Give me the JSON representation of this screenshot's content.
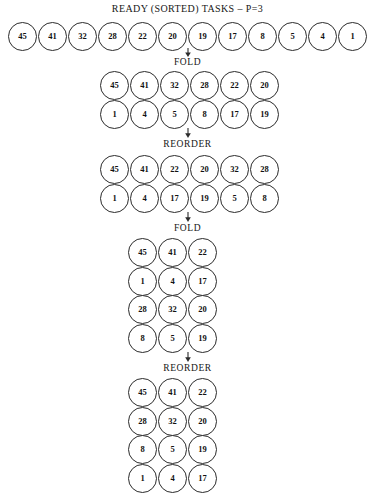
{
  "title": "READY (SORTED) TASKS – P=3",
  "footer_note": "",
  "colors": {
    "background": "#ffffff",
    "stroke": "#2b2b2b",
    "text": "#111111"
  },
  "labels": {
    "fold": "FOLD",
    "reorder": "REORDER"
  },
  "chart_data": {
    "type": "diagram",
    "title": "READY (SORTED) TASKS – P=3",
    "processors": 3,
    "stages": [
      {
        "name": "initial",
        "label": "",
        "columns": 12,
        "rows": [
          [
            45,
            41,
            32,
            28,
            22,
            20,
            19,
            17,
            8,
            5,
            4,
            1
          ]
        ]
      },
      {
        "name": "fold-1",
        "label": "FOLD",
        "columns": 6,
        "rows": [
          [
            45,
            41,
            32,
            28,
            22,
            20
          ],
          [
            1,
            4,
            5,
            8,
            17,
            19
          ]
        ]
      },
      {
        "name": "reorder-1",
        "label": "REORDER",
        "columns": 6,
        "rows": [
          [
            45,
            41,
            22,
            20,
            32,
            28
          ],
          [
            1,
            4,
            17,
            19,
            5,
            8
          ]
        ]
      },
      {
        "name": "fold-2",
        "label": "FOLD",
        "columns": 3,
        "rows": [
          [
            45,
            41,
            22
          ],
          [
            1,
            4,
            17
          ],
          [
            28,
            32,
            20
          ],
          [
            8,
            5,
            19
          ]
        ]
      },
      {
        "name": "reorder-2",
        "label": "REORDER",
        "columns": 3,
        "rows": [
          [
            45,
            41,
            22
          ],
          [
            28,
            32,
            20
          ],
          [
            8,
            5,
            19
          ],
          [
            1,
            4,
            17
          ]
        ]
      }
    ]
  }
}
